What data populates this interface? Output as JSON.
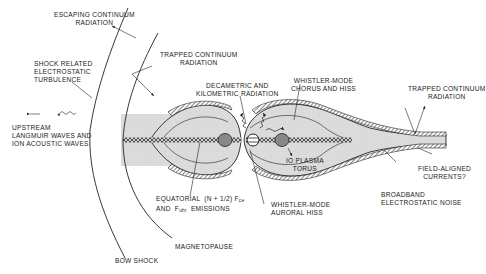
{
  "diagram": {
    "colors": {
      "ink": "#222222",
      "plasma_fill": "#d9d9d9",
      "sheet_fill": "#c8c8c8",
      "background": "#ffffff"
    },
    "labels": {
      "escaping_continuum": "ESCAPING CONTINUUM\nRADIATION",
      "trapped_continuum_left": "TRAPPED CONTINUUM\nRADIATION",
      "shock_turbulence": "SHOCK RELATED\nELECTROSTATIC\nTURBULENCE",
      "upstream_waves": "UPSTREAM\nLANGMUIR WAVES AND\nION ACOUSTIC WAVES",
      "decametric": "DECAMETRIC AND\nKILOMETRIC RADIATION",
      "whistler_chorus": "WHISTLER-MODE\nCHORUS AND HISS",
      "trapped_continuum_right": "TRAPPED CONTINUUM\nRADIATION",
      "io_torus": "IO PLASMA\nTORUS",
      "field_aligned": "FIELD-ALIGNED\nCURRENTS?",
      "broadband": "BROADBAND\nELECTROSTATIC NOISE",
      "whistler_auroral": "WHISTLER-MODE\nAURORAL HISS",
      "equatorial_line1_pre": "EQUATORIAL  (n + 1/2) f",
      "equatorial_line1_sub": "ce",
      "equatorial_line2_pre": "AND  f",
      "equatorial_line2_sub": "uhr",
      "equatorial_line2_post": "  EMISSIONS",
      "magnetopause": "MAGNETOPAUSE",
      "bow_shock": "BOW SHOCK"
    }
  }
}
